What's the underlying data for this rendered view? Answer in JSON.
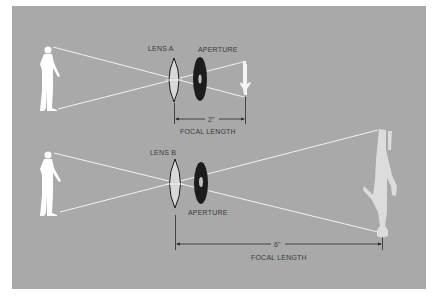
{
  "colors": {
    "panel": "#a9a9a9",
    "ray": "#f2f2f2",
    "lens_fill": "#d8d8d8",
    "lens_stroke": "#1a1a1a",
    "aperture": "#1c1c1c",
    "person": "#ffffff",
    "image_small": "#f4f4f4",
    "image_large": "#dcdcdc",
    "dimension_line": "#2a2a2a",
    "text": "#3a3a3a"
  },
  "top": {
    "lens_label": "LENS A",
    "aperture_label": "APERTURE",
    "distance_label": "2\"",
    "focal_label": "FOCAL LENGTH"
  },
  "bottom": {
    "lens_label": "LENS B",
    "aperture_label": "APERTURE",
    "distance_label": "6\"",
    "focal_label": "FOCAL LENGTH"
  }
}
